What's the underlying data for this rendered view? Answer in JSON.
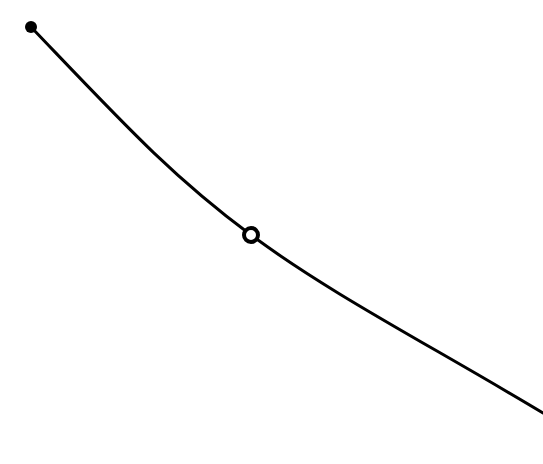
{
  "diagram": {
    "background": "#ffffff",
    "stroke_color": "#000000",
    "stroke_width": 3,
    "curve": {
      "description": "smooth decreasing convex curve",
      "start": [
        31,
        27
      ],
      "end": [
        543,
        413
      ],
      "path": "M 31 27 C 120 120, 170 175, 251 235 S 430 345, 543 413"
    },
    "points": [
      {
        "label": "start-point",
        "x": 31,
        "y": 27,
        "style": "filled",
        "r": 6
      },
      {
        "label": "marked-point",
        "x": 251,
        "y": 235,
        "style": "open",
        "r": 7
      }
    ]
  }
}
